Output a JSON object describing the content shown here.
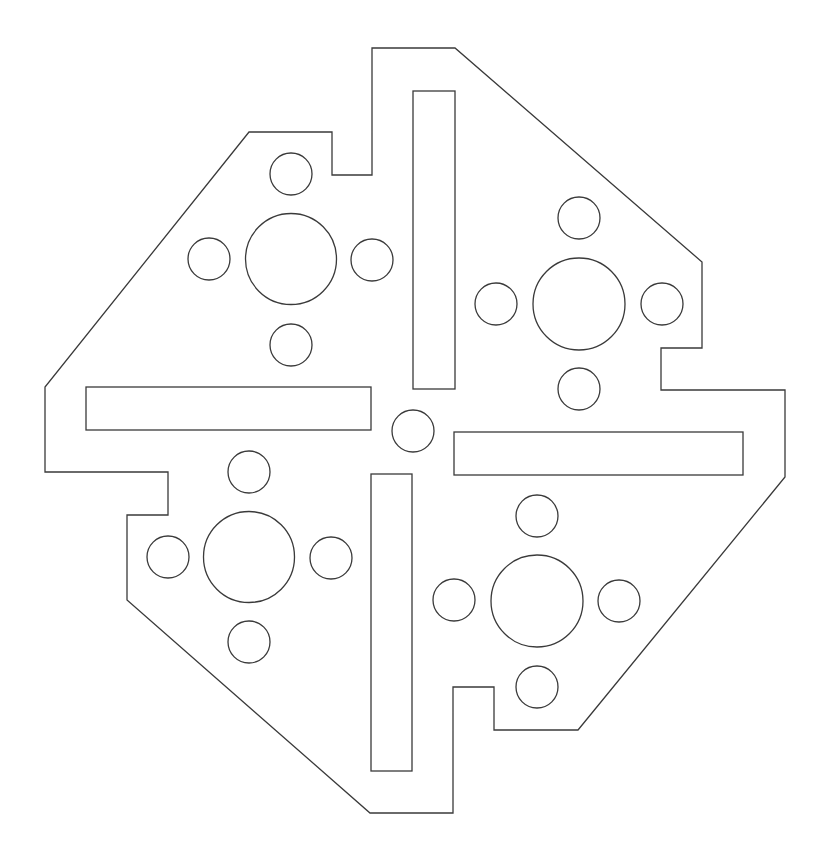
{
  "diagram": {
    "type": "plate-outline-drawing",
    "colors": {
      "line": "#3a3a3a",
      "background": "#ffffff"
    },
    "outline": [
      [
        372,
        48
      ],
      [
        455,
        48
      ],
      [
        702,
        262
      ],
      [
        702,
        348
      ],
      [
        661,
        348
      ],
      [
        661,
        390
      ],
      [
        785,
        390
      ],
      [
        785,
        477
      ],
      [
        578,
        730
      ],
      [
        494,
        730
      ],
      [
        494,
        687
      ],
      [
        453,
        687
      ],
      [
        453,
        813
      ],
      [
        370,
        813
      ],
      [
        127,
        600
      ],
      [
        127,
        515
      ],
      [
        168,
        515
      ],
      [
        168,
        472
      ],
      [
        45,
        472
      ],
      [
        45,
        387
      ],
      [
        249,
        132
      ],
      [
        332,
        132
      ],
      [
        332,
        175
      ],
      [
        372,
        175
      ]
    ],
    "slots": [
      {
        "name": "slot-top-vertical",
        "x": 413,
        "y": 91,
        "w": 42,
        "h": 298
      },
      {
        "name": "slot-left-horizontal",
        "x": 86,
        "y": 387,
        "w": 285,
        "h": 43
      },
      {
        "name": "slot-right-horizontal",
        "x": 454,
        "y": 432,
        "w": 289,
        "h": 43
      },
      {
        "name": "slot-bottom-vertical",
        "x": 371,
        "y": 474,
        "w": 41,
        "h": 297
      }
    ],
    "center_hole": {
      "cx": 413,
      "cy": 431,
      "r": 21
    },
    "hole_groups": [
      {
        "name": "top-left",
        "cx": 291,
        "cy": 259,
        "r": 45.5,
        "satellites": [
          [
            291,
            174
          ],
          [
            209,
            259
          ],
          [
            372,
            260
          ],
          [
            291,
            345
          ]
        ],
        "sat_r": 21
      },
      {
        "name": "top-right",
        "cx": 579,
        "cy": 304,
        "r": 46,
        "satellites": [
          [
            579,
            218
          ],
          [
            496,
            304
          ],
          [
            662,
            304
          ],
          [
            579,
            389
          ]
        ],
        "sat_r": 21
      },
      {
        "name": "bottom-left",
        "cx": 249,
        "cy": 557,
        "r": 45.5,
        "satellites": [
          [
            249,
            472
          ],
          [
            168,
            557
          ],
          [
            331,
            558
          ],
          [
            249,
            642
          ]
        ],
        "sat_r": 21
      },
      {
        "name": "bottom-right",
        "cx": 537,
        "cy": 601,
        "r": 46,
        "satellites": [
          [
            537,
            516
          ],
          [
            454,
            600
          ],
          [
            619,
            601
          ],
          [
            537,
            687
          ]
        ],
        "sat_r": 21
      }
    ]
  }
}
